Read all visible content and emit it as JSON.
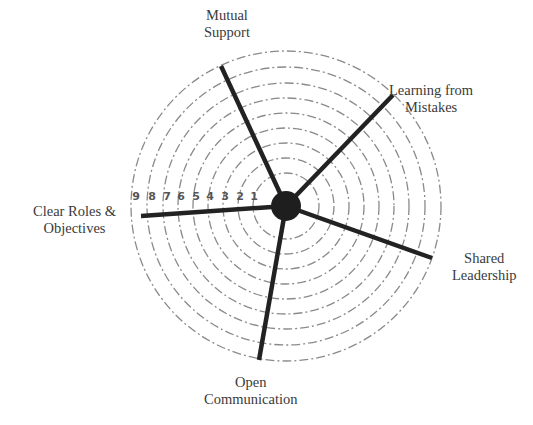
{
  "diagram": {
    "type": "radar-wheel",
    "center": {
      "x": 286,
      "y": 206
    },
    "hub_radius": 15,
    "ring_count": 9,
    "ring_radii": [
      33,
      48,
      63,
      78,
      93,
      108,
      123,
      139,
      155
    ],
    "colors": {
      "ring": "#8a8a8a",
      "spoke": "#222222",
      "hub": "#1e1e1e",
      "text": "#3a3a3a",
      "scale_numbers": "#555555"
    },
    "scale": {
      "labels": [
        "9",
        "8",
        "7",
        "6",
        "5",
        "4",
        "3",
        "2",
        "1"
      ],
      "positions_x": [
        136,
        152,
        167,
        181,
        196,
        210,
        225,
        240,
        254
      ],
      "y": 200
    },
    "spokes": [
      {
        "name": "Mutual Support",
        "end": {
          "x": 221,
          "y": 66
        }
      },
      {
        "name": "Learning from Mistakes",
        "end": {
          "x": 393,
          "y": 95
        }
      },
      {
        "name": "Shared Leadership",
        "end": {
          "x": 432,
          "y": 258
        }
      },
      {
        "name": "Open Communication",
        "end": {
          "x": 259,
          "y": 360
        }
      },
      {
        "name": "Clear Roles & Objectives",
        "end": {
          "x": 141,
          "y": 216
        }
      }
    ],
    "labels": {
      "mutual_support": {
        "line1": "Mutual",
        "line2": "Support"
      },
      "learning_from_mistakes": {
        "line1": "Learning from",
        "line2": "Mistakes"
      },
      "shared_leadership": {
        "line1": "Shared",
        "line2": "Leadership"
      },
      "open_communication": {
        "line1": "Open",
        "line2": "Communication"
      },
      "clear_roles": {
        "line1": "Clear Roles &",
        "line2": "Objectives"
      }
    }
  }
}
